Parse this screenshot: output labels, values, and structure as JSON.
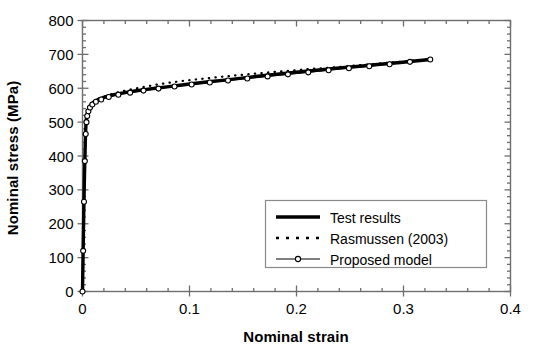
{
  "chart_data": {
    "type": "line",
    "title": "",
    "xlabel": "Nominal strain",
    "ylabel": "Nominal stress (MPa)",
    "xlim": [
      0,
      0.4
    ],
    "ylim": [
      0,
      800
    ],
    "xticks": [
      0,
      0.1,
      0.2,
      0.3,
      0.4
    ],
    "xtick_labels": [
      "0",
      "0.1",
      "0.2",
      "0.3",
      "0.4"
    ],
    "yticks": [
      0,
      100,
      200,
      300,
      400,
      500,
      600,
      700,
      800
    ],
    "ytick_labels": [
      "0",
      "100",
      "200",
      "300",
      "400",
      "500",
      "600",
      "700",
      "800"
    ],
    "x_minor_step": 0.02,
    "y_minor_step": 20,
    "grid": false,
    "legend_position": "lower-right",
    "series": [
      {
        "name": "Test results",
        "style": "solid-thick",
        "color": "#000000",
        "x": [
          0,
          0.0003,
          0.0007,
          0.0011,
          0.0015,
          0.0019,
          0.0023,
          0.0026,
          0.0029,
          0.0032,
          0.0036,
          0.004,
          0.0045,
          0.005,
          0.0056,
          0.0063,
          0.0072,
          0.0085,
          0.01,
          0.0125,
          0.0155,
          0.019,
          0.023,
          0.028,
          0.034,
          0.041,
          0.049,
          0.058,
          0.068,
          0.079,
          0.091,
          0.104,
          0.118,
          0.133,
          0.149,
          0.166,
          0.184,
          0.202,
          0.221,
          0.24,
          0.259,
          0.278,
          0.297,
          0.313,
          0.325
        ],
        "y": [
          0,
          60,
          140,
          220,
          290,
          350,
          400,
          440,
          470,
          492,
          508,
          518,
          525,
          531,
          537,
          543,
          548,
          553,
          558,
          563,
          568,
          572,
          576,
          580,
          584,
          588,
          592,
          596,
          600,
          604,
          609,
          614,
          619,
          624,
          630,
          636,
          642,
          648,
          654,
          660,
          665,
          671,
          676,
          681,
          685
        ]
      },
      {
        "name": "Rasmussen (2003)",
        "style": "dotted",
        "color": "#000000",
        "x": [
          0,
          0.0005,
          0.0012,
          0.002,
          0.0028,
          0.0034,
          0.004,
          0.0048,
          0.0058,
          0.0072,
          0.009,
          0.0115,
          0.015,
          0.0195,
          0.025,
          0.032,
          0.04,
          0.049,
          0.059,
          0.07,
          0.082,
          0.095,
          0.109,
          0.124,
          0.14,
          0.157,
          0.175,
          0.194,
          0.213,
          0.232,
          0.251,
          0.27,
          0.289,
          0.307,
          0.325
        ],
        "y": [
          0,
          105,
          240,
          355,
          450,
          495,
          518,
          532,
          542,
          550,
          557,
          563,
          569,
          575,
          581,
          587,
          593,
          599,
          605,
          611,
          617,
          622,
          627,
          632,
          637,
          642,
          647,
          652,
          657,
          661,
          666,
          671,
          676,
          681,
          686
        ]
      },
      {
        "name": "Proposed model",
        "style": "solid-thin-marker",
        "color": "#000000",
        "marker": "circle-open",
        "x": [
          0,
          0.0006,
          0.0014,
          0.0022,
          0.003,
          0.0037,
          0.0044,
          0.0055,
          0.007,
          0.0092,
          0.0125,
          0.0175,
          0.0245,
          0.0335,
          0.0445,
          0.057,
          0.071,
          0.086,
          0.102,
          0.119,
          0.136,
          0.154,
          0.173,
          0.192,
          0.211,
          0.23,
          0.249,
          0.268,
          0.287,
          0.306,
          0.325
        ],
        "y": [
          0,
          120,
          265,
          385,
          465,
          500,
          518,
          532,
          543,
          552,
          560,
          567,
          574,
          581,
          587,
          593,
          599,
          605,
          611,
          617,
          623,
          629,
          635,
          641,
          647,
          653,
          659,
          665,
          671,
          678,
          685
        ]
      }
    ]
  },
  "legend": {
    "items": [
      {
        "label": "Test results",
        "style": "solid-thick"
      },
      {
        "label": "Rasmussen (2003)",
        "style": "dotted"
      },
      {
        "label": "Proposed model",
        "style": "solid-thin-marker"
      }
    ]
  },
  "colors": {
    "axis": "#6e6e6e",
    "curve": "#101010",
    "legend_border": "#8a8a8a",
    "background": "#ffffff"
  }
}
